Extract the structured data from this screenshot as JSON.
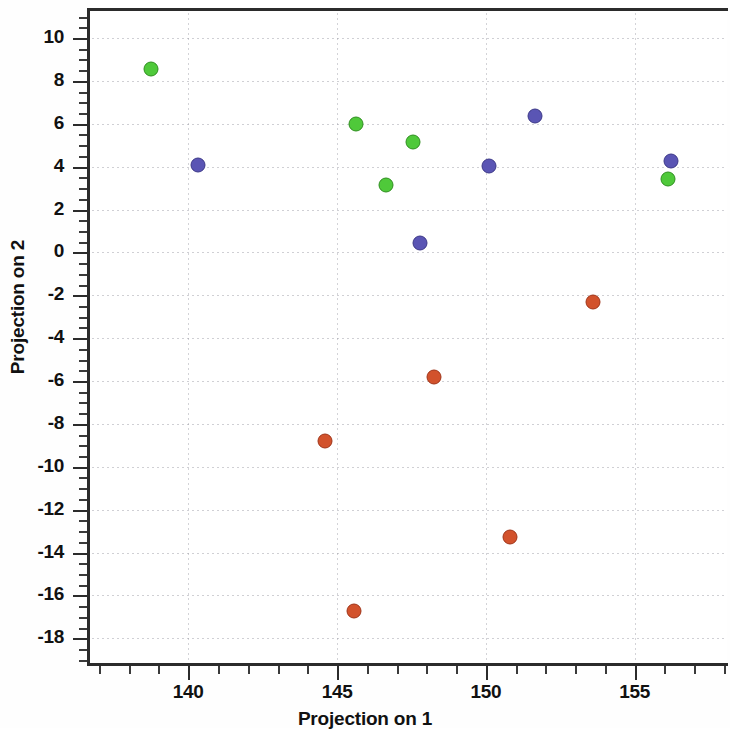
{
  "chart_data": {
    "type": "scatter",
    "title": "",
    "xlabel": "Projection on 1",
    "ylabel": "Projection on 2",
    "xlim": [
      136.6,
      158.1
    ],
    "ylim": [
      -19.2,
      11.4
    ],
    "xticks": [
      140,
      145,
      150,
      155
    ],
    "yticks": [
      10,
      8,
      6,
      4,
      2,
      0,
      -2,
      -4,
      -6,
      -8,
      -10,
      -12,
      -14,
      -16,
      -18
    ],
    "xtick_labels": [
      "140",
      "145",
      "150",
      "155"
    ],
    "ytick_labels": [
      "10",
      "8",
      "6",
      "4",
      "2",
      "0",
      "-2",
      "-4",
      "-6",
      "-8",
      "-10",
      "-12",
      "-14",
      "-16",
      "-18"
    ],
    "minor_tick_interval_x": 1,
    "minor_tick_interval_y": 0.5,
    "grid": true,
    "grid_style": "dotted",
    "legend": null,
    "legend_position": "none",
    "series": [
      {
        "name": "green-group",
        "color": "#4fc93a",
        "edge_color": "#2f8f1f",
        "marker": "circle",
        "points": [
          {
            "x": 138.75,
            "y": 8.55
          },
          {
            "x": 145.65,
            "y": 5.97
          },
          {
            "x": 147.54,
            "y": 5.17
          },
          {
            "x": 146.66,
            "y": 3.15
          },
          {
            "x": 156.13,
            "y": 3.44
          }
        ]
      },
      {
        "name": "blue-group",
        "color": "#5a55b4",
        "edge_color": "#3c3888",
        "marker": "circle",
        "points": [
          {
            "x": 140.33,
            "y": 4.09
          },
          {
            "x": 151.65,
            "y": 6.35
          },
          {
            "x": 150.1,
            "y": 4.05
          },
          {
            "x": 156.23,
            "y": 4.28
          },
          {
            "x": 147.78,
            "y": 0.44
          }
        ]
      },
      {
        "name": "red-group",
        "color": "#d2522c",
        "edge_color": "#a03418",
        "marker": "circle",
        "points": [
          {
            "x": 153.61,
            "y": -2.33
          },
          {
            "x": 148.25,
            "y": -5.8
          },
          {
            "x": 144.58,
            "y": -8.8
          },
          {
            "x": 150.81,
            "y": -13.26
          },
          {
            "x": 145.56,
            "y": -16.73
          }
        ]
      }
    ]
  }
}
